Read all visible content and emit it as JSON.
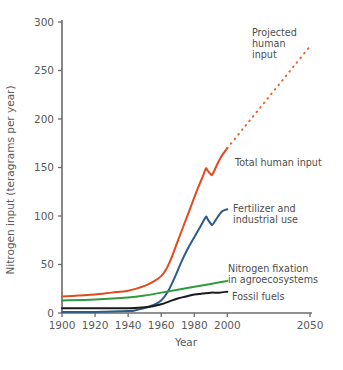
{
  "chart_data": {
    "type": "line",
    "title": "",
    "xlabel": "Year",
    "ylabel": "Nitrogen input (teragrams per year)",
    "xlim": [
      1900,
      2050
    ],
    "ylim": [
      0,
      300
    ],
    "xticks": [
      1900,
      1920,
      1940,
      1960,
      1980,
      2000,
      2050
    ],
    "xtick_labels": [
      "1900",
      "1920",
      "1940",
      "1960",
      "1980",
      "2000",
      "2050"
    ],
    "yticks": [
      0,
      50,
      100,
      150,
      200,
      250,
      300
    ],
    "ytick_labels": [
      "0",
      "50",
      "100",
      "150",
      "200",
      "250",
      "300"
    ],
    "grid": false,
    "legend_position": "inline-annotations",
    "series": [
      {
        "name": "Total human input",
        "color": "#E04A1F",
        "style": "solid",
        "x": [
          1900,
          1910,
          1920,
          1930,
          1940,
          1950,
          1955,
          1960,
          1963,
          1966,
          1970,
          1974,
          1978,
          1982,
          1985,
          1987,
          1988,
          1990,
          1991,
          1993,
          1995,
          1997,
          2000
        ],
        "values": [
          17,
          18,
          19,
          21,
          23,
          28,
          32,
          38,
          45,
          56,
          74,
          92,
          110,
          128,
          140,
          149,
          147,
          143,
          143,
          150,
          157,
          163,
          170
        ]
      },
      {
        "name": "Projected human input",
        "color": "#E06A33",
        "style": "dashed",
        "x": [
          2000,
          2010,
          2020,
          2030,
          2040,
          2050
        ],
        "values": [
          170,
          191,
          212,
          233,
          254,
          275
        ]
      },
      {
        "name": "Fertilizer and industrial use",
        "color": "#2E5C8A",
        "style": "solid",
        "x": [
          1900,
          1920,
          1940,
          1945,
          1950,
          1955,
          1960,
          1964,
          1968,
          1972,
          1976,
          1980,
          1984,
          1987,
          1988,
          1990,
          1991,
          1993,
          1995,
          1997,
          2000
        ],
        "values": [
          1,
          1,
          2,
          3,
          5,
          8,
          13,
          22,
          36,
          52,
          66,
          78,
          90,
          99,
          97,
          92,
          91,
          96,
          101,
          105,
          107
        ]
      },
      {
        "name": "Nitrogen fixation in agroecosystems",
        "color": "#2E9B3E",
        "style": "solid",
        "x": [
          1900,
          1920,
          1940,
          1950,
          1960,
          1970,
          1980,
          1990,
          2000
        ],
        "values": [
          13,
          14,
          16,
          18,
          21,
          24,
          27,
          30,
          33
        ]
      },
      {
        "name": "Fossil fuels",
        "color": "#1A1A1A",
        "style": "solid",
        "x": [
          1900,
          1920,
          1940,
          1950,
          1955,
          1960,
          1965,
          1970,
          1975,
          1980,
          1985,
          1990,
          1995,
          2000
        ],
        "values": [
          5,
          5,
          5,
          6,
          7,
          9,
          12,
          15,
          17,
          19,
          20,
          21,
          21,
          22
        ]
      }
    ],
    "annotations": [
      {
        "id": "projected-human-input",
        "lines": [
          "Projected",
          "human",
          "input"
        ],
        "x": 252,
        "y": 36,
        "color": "#4d4d4d"
      },
      {
        "id": "total-human-input",
        "lines": [
          "Total human input"
        ],
        "x": 235,
        "y": 166,
        "color": "#4d4d4d"
      },
      {
        "id": "fertilizer-industrial-use",
        "lines": [
          "Fertilizer and",
          "industrial use"
        ],
        "x": 233,
        "y": 212,
        "color": "#4d4d4d"
      },
      {
        "id": "nitrogen-fixation-agroecosystems",
        "lines": [
          "Nitrogen fixation",
          "in agroecosystems"
        ],
        "x": 228,
        "y": 272,
        "color": "#4d4d4d"
      },
      {
        "id": "fossil-fuels",
        "lines": [
          "Fossil fuels"
        ],
        "x": 232,
        "y": 300,
        "color": "#4d4d4d"
      }
    ],
    "axis_color": "#6b6b6b",
    "text_color": "#5a5a5a",
    "background": "#ffffff"
  }
}
